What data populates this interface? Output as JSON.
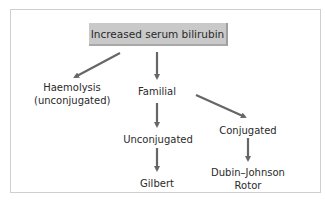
{
  "diagram": {
    "type": "flowchart",
    "root": {
      "label": "Increased serum bilirubin"
    },
    "nodes": {
      "haemolysis": {
        "line1": "Haemolysis",
        "line2": "(unconjugated)"
      },
      "familial": {
        "label": "Familial"
      },
      "unconjugated": {
        "label": "Unconjugated"
      },
      "conjugated": {
        "label": "Conjugated"
      },
      "gilbert": {
        "label": "Gilbert"
      },
      "dubin": {
        "line1": "Dubin–Johnson",
        "line2": "Rotor"
      }
    },
    "edges": [
      {
        "from": "Increased serum bilirubin",
        "to": "Haemolysis (unconjugated)"
      },
      {
        "from": "Increased serum bilirubin",
        "to": "Familial"
      },
      {
        "from": "Familial",
        "to": "Unconjugated"
      },
      {
        "from": "Familial",
        "to": "Conjugated"
      },
      {
        "from": "Unconjugated",
        "to": "Gilbert"
      },
      {
        "from": "Conjugated",
        "to": "Dubin–Johnson Rotor"
      }
    ],
    "colors": {
      "box_fill": "#c9c9c9",
      "arrow": "#666666",
      "frame": "#cfcfcf"
    }
  }
}
